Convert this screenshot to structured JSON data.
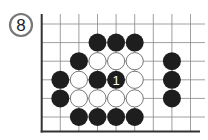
{
  "diagram": {
    "number_label": "8",
    "board": {
      "origin_x": 41.7,
      "origin_y": 24,
      "spacing": 18.6,
      "columns": 9,
      "rows": 6,
      "top_extent": 14,
      "right_extent": 205,
      "bottom_edge_y": 131.5,
      "line_color": "#888888",
      "edge_color": "#333333"
    },
    "stones": [
      {
        "col": 3,
        "row": 1,
        "color": "black"
      },
      {
        "col": 4,
        "row": 1,
        "color": "black"
      },
      {
        "col": 5,
        "row": 1,
        "color": "black"
      },
      {
        "col": 2,
        "row": 2,
        "color": "black"
      },
      {
        "col": 3,
        "row": 2,
        "color": "white"
      },
      {
        "col": 4,
        "row": 2,
        "color": "white"
      },
      {
        "col": 5,
        "row": 2,
        "color": "white"
      },
      {
        "col": 7,
        "row": 2,
        "color": "black"
      },
      {
        "col": 1,
        "row": 3,
        "color": "black"
      },
      {
        "col": 2,
        "row": 3,
        "color": "white"
      },
      {
        "col": 3,
        "row": 3,
        "color": "black"
      },
      {
        "col": 4,
        "row": 3,
        "color": "black",
        "label": "1"
      },
      {
        "col": 5,
        "row": 3,
        "color": "white"
      },
      {
        "col": 7,
        "row": 3,
        "color": "black"
      },
      {
        "col": 1,
        "row": 4,
        "color": "black"
      },
      {
        "col": 2,
        "row": 4,
        "color": "white"
      },
      {
        "col": 3,
        "row": 4,
        "color": "white"
      },
      {
        "col": 4,
        "row": 4,
        "color": "white"
      },
      {
        "col": 5,
        "row": 4,
        "color": "white"
      },
      {
        "col": 7,
        "row": 4,
        "color": "black"
      },
      {
        "col": 2,
        "row": 5,
        "color": "black"
      },
      {
        "col": 3,
        "row": 5,
        "color": "black"
      },
      {
        "col": 4,
        "row": 5,
        "color": "black"
      },
      {
        "col": 5,
        "row": 5,
        "color": "black"
      }
    ],
    "colors": {
      "black_stone": "#1e1e1e",
      "white_stone": "#ffffff",
      "white_stone_border": "#555555",
      "move_label": "#ffffff"
    }
  }
}
